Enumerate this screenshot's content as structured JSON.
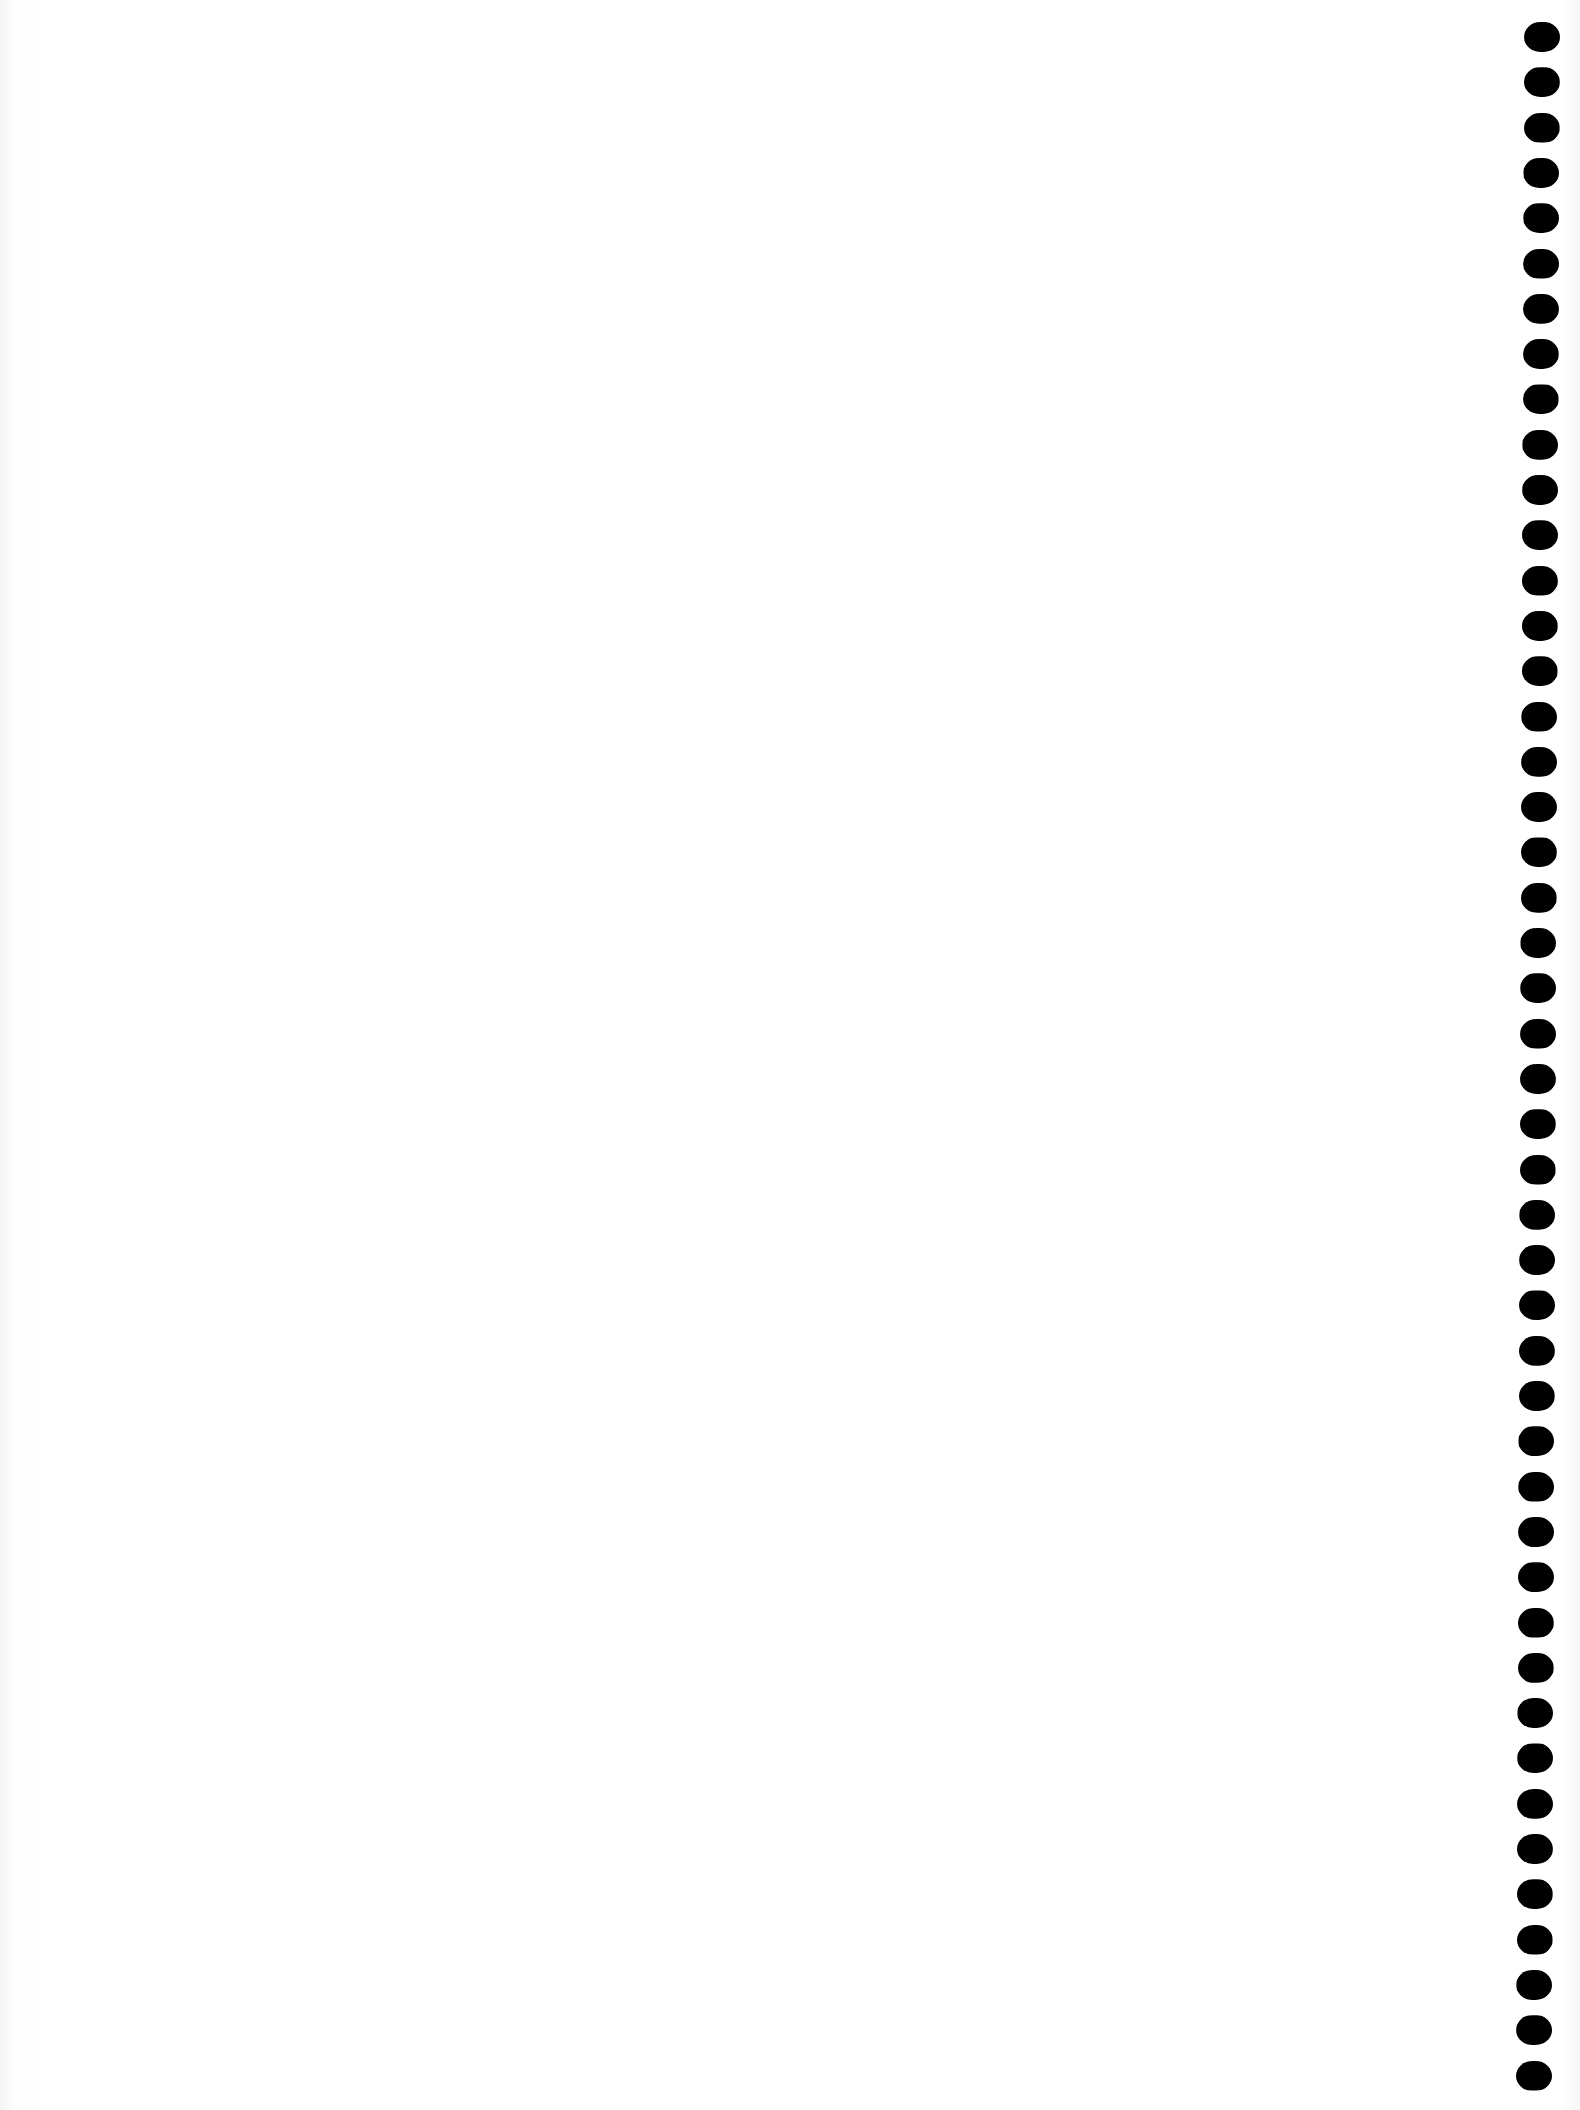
{
  "page": {
    "type": "blank scanned sheet",
    "background": "#ffffff",
    "content_text": ""
  },
  "perforation": {
    "side": "right",
    "hole_count": 46,
    "hole_color": "#000000",
    "first_hole_top": 22,
    "pitch": 45.3,
    "x_top": 1524,
    "x_bottom": 1516,
    "hole_width": 36,
    "hole_height": 30
  }
}
